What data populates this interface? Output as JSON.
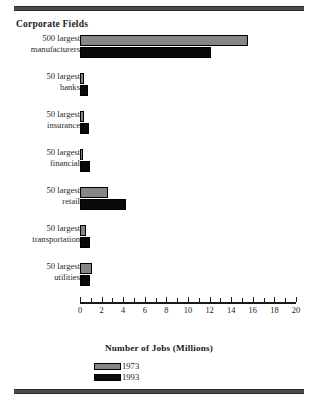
{
  "chart_title": "Corporate Fields",
  "axis_title": "Number of Jobs (Millions)",
  "legend": [
    {
      "key": "y1973",
      "label": "1973",
      "color": "#868686"
    },
    {
      "key": "y1993",
      "label": "1993",
      "color": "#0a0a0a"
    }
  ],
  "tick_labels": [
    "0",
    "2",
    "4",
    "6",
    "8",
    "10",
    "12",
    "14",
    "16",
    "18",
    "20"
  ],
  "categories": [
    {
      "line1": "500 largest",
      "line2": "manufacturers"
    },
    {
      "line1": "50 largest",
      "line2": "banks"
    },
    {
      "line1": "50 largest",
      "line2": "insurance"
    },
    {
      "line1": "50 largest",
      "line2": "financial"
    },
    {
      "line1": "50 largest",
      "line2": "retail"
    },
    {
      "line1": "50 largest",
      "line2": "transportation"
    },
    {
      "line1": "50 largest",
      "line2": "utilities"
    }
  ],
  "chart_data": {
    "type": "bar",
    "orientation": "horizontal",
    "title": "Corporate Fields",
    "xlabel": "Number of Jobs (Millions)",
    "ylabel": "",
    "xlim": [
      0,
      20
    ],
    "xticks": [
      0,
      2,
      4,
      6,
      8,
      10,
      12,
      14,
      16,
      18,
      20
    ],
    "minor_ticks_every": 1,
    "grid": false,
    "legend_position": "bottom-left",
    "categories": [
      "500 largest manufacturers",
      "50 largest banks",
      "50 largest insurance",
      "50 largest financial",
      "50 largest retail",
      "50 largest transportation",
      "50 largest utilities"
    ],
    "series": [
      {
        "name": "1973",
        "color": "#868686",
        "values": [
          15.6,
          0.35,
          0.35,
          0.3,
          2.6,
          0.55,
          1.1
        ]
      },
      {
        "name": "1993",
        "color": "#0a0a0a",
        "values": [
          12.1,
          0.7,
          0.8,
          0.9,
          4.3,
          0.95,
          0.9
        ]
      }
    ]
  }
}
